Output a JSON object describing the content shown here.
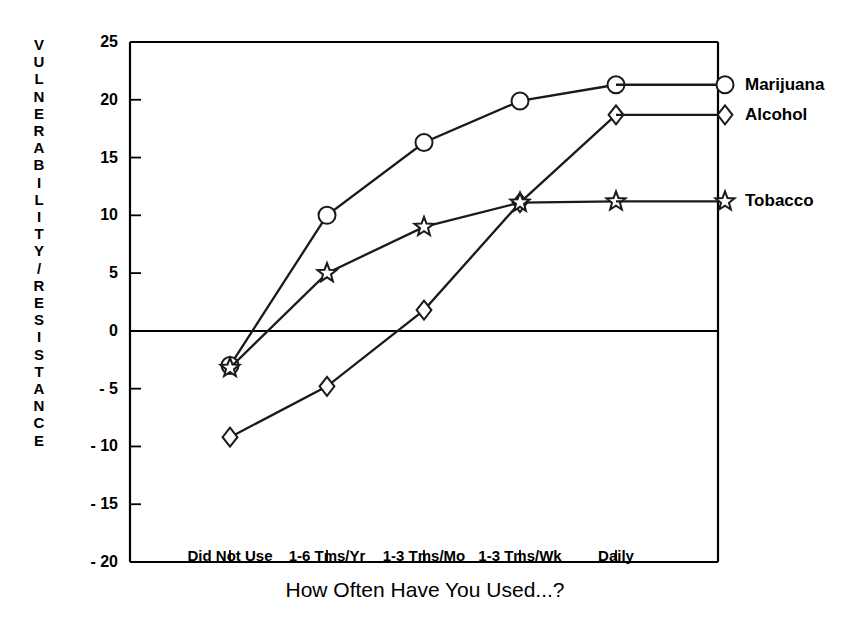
{
  "chart_data": {
    "type": "line",
    "title": "",
    "xlabel": "How Often Have You Used...?",
    "ylabel": "VULNERABILITY/RESISTANCE",
    "categories": [
      "Did Not Use",
      "1-6 Tms/Yr",
      "1-3 Tms/Mo",
      "1-3 Tms/Wk",
      "Daily"
    ],
    "ylim": [
      -20,
      25
    ],
    "yticks": [
      25,
      20,
      15,
      10,
      5,
      0,
      -5,
      -10,
      -15,
      -20
    ],
    "ytick_labels": [
      "25",
      "20",
      "15",
      "10",
      "5",
      "0",
      "- 5",
      "- 10",
      "- 15",
      "- 20"
    ],
    "grid": false,
    "legend_position": "right-inline",
    "zero_line": true,
    "series": [
      {
        "name": "Marijuana",
        "marker": "circle",
        "values": [
          -3.0,
          10.0,
          16.3,
          19.9,
          21.3
        ]
      },
      {
        "name": "Alcohol",
        "marker": "diamond",
        "values": [
          -9.2,
          -4.8,
          1.8,
          11.1,
          18.7
        ]
      },
      {
        "name": "Tobacco",
        "marker": "star",
        "values": [
          -3.2,
          5.0,
          9.0,
          11.1,
          11.2
        ]
      }
    ]
  },
  "axis": {
    "y_title_letters": "V\nU\nL\nN\nE\nR\nA\nB\nI\nL\nI\nT\nY\n/\nR\nE\nS\nI\nS\nT\nA\nN\nC\nE"
  },
  "style": {
    "line_color": "#1a1a1a",
    "axis_color": "#000000",
    "background": "#ffffff"
  }
}
